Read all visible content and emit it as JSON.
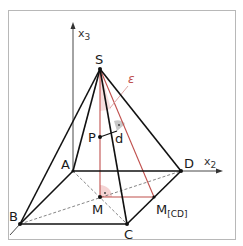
{
  "figure": {
    "type": "3D pyramid geometry diagram",
    "frame_color": "#b0b0b0",
    "edge_color": "#111111",
    "construction_color": "#c0504d",
    "angle_fill": "#f2c9c9"
  },
  "axes": {
    "x3": {
      "name": "x",
      "sub": "3"
    },
    "x2": {
      "name": "x",
      "sub": "2"
    }
  },
  "points": {
    "S": "S",
    "A": "A",
    "B": "B",
    "C": "C",
    "D": "D",
    "M": "M",
    "P": "P",
    "MCD": {
      "name": "M",
      "sub": "[CD]"
    }
  },
  "labels": {
    "plane": "ε",
    "distance": "d"
  }
}
